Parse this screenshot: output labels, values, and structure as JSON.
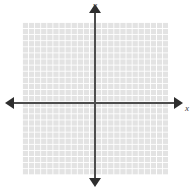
{
  "figure": {
    "type": "cartesian-coordinate-grid",
    "background_color": "#ffffff",
    "width": 194,
    "height": 190
  },
  "grid": {
    "fill_color": "#e3e3e3",
    "line_color": "#ffffff",
    "cell_size_px": 6.1,
    "left_px": 22,
    "top_px": 22,
    "width_px": 146,
    "height_px": 153,
    "columns": 24,
    "rows": 25
  },
  "axes": {
    "color": "#4d4d4d",
    "arrow_color": "#2e2e2e",
    "origin": {
      "x_px": 95,
      "y_px": 103
    },
    "x": {
      "label": "y",
      "name": "x-axis",
      "start_px": 12,
      "end_px": 178,
      "arrow_start": "left",
      "arrow_end": "right"
    },
    "y": {
      "label": "x",
      "name": "y-axis",
      "start_px": 12,
      "end_px": 182,
      "arrow_start": "up",
      "arrow_end": "down"
    }
  },
  "labels": {
    "x_axis_label": "x",
    "y_axis_label": "y"
  },
  "chart_data": {
    "type": "scatter",
    "title": "",
    "subtitle": "",
    "xlabel": "x",
    "ylabel": "y",
    "series": [],
    "x": [],
    "values": [],
    "categories": [],
    "xlim": [
      -12,
      12
    ],
    "ylim": [
      -13,
      12
    ],
    "grid": true,
    "legend": false,
    "legend_position": "none",
    "annotations": [],
    "xticks": [],
    "yticks": [],
    "xticklabels": [],
    "yticklabels": []
  }
}
